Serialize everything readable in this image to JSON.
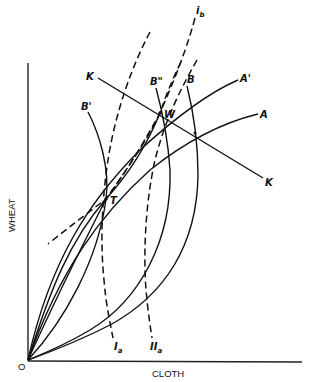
{
  "diagram": {
    "title": "",
    "axes": {
      "x_label": "CLOTH",
      "y_label": "WHEAT",
      "origin_label": "O"
    },
    "points": {
      "T": "T",
      "W": "W"
    },
    "curves": {
      "A": "A",
      "A_prime": "A'",
      "B": "B",
      "B_prime": "B'",
      "B_double_prime": "B\"",
      "K_top": "K",
      "K_bottom": "K",
      "i_b_main": "i",
      "i_b_sub": "b",
      "I_alpha_main": "I",
      "I_alpha_sub": "a",
      "II_alpha_main": "II",
      "II_alpha_sub": "a"
    },
    "line_styles": {
      "solid": [
        "A",
        "A'",
        "B",
        "B'",
        "B\"",
        "K"
      ],
      "dashed": [
        "i_b",
        "I_a",
        "II_a"
      ]
    },
    "colors": {
      "ink": "#111111",
      "background": "#ffffff"
    }
  }
}
